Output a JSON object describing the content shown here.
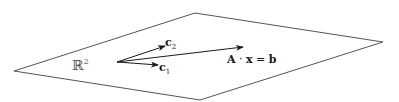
{
  "diagram": {
    "plane": {
      "label": "ℝ",
      "label_superscript": "2",
      "vertices": [
        [
          14,
          71
        ],
        [
          195,
          13
        ],
        [
          383,
          42
        ],
        [
          200,
          100
        ]
      ],
      "stroke_color": "#555555"
    },
    "vectors": [
      {
        "name": "c2",
        "label": "c",
        "subscript": "2",
        "from": [
          117,
          62
        ],
        "to": [
          165,
          46
        ]
      },
      {
        "name": "c1",
        "label": "c",
        "subscript": "1",
        "from": [
          117,
          62
        ],
        "to": [
          158,
          65
        ]
      },
      {
        "name": "b",
        "from": [
          117,
          62
        ],
        "to": [
          243,
          47
        ]
      }
    ],
    "equation": {
      "lhs_matrix": "A",
      "operator": "·",
      "lhs_vector": "x",
      "equals": "=",
      "rhs": "b"
    },
    "arrow_color": "#1a1a1a"
  }
}
